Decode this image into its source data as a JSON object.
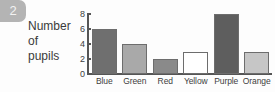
{
  "question": {
    "number": "2"
  },
  "chart_data": {
    "type": "bar",
    "title": "",
    "ylabel_lines": [
      "Number",
      "of",
      "pupils"
    ],
    "ylabel": "Number of pupils",
    "xlabel": "",
    "categories": [
      "Blue",
      "Green",
      "Red",
      "Yellow",
      "Purple",
      "Orange"
    ],
    "values": [
      6,
      4,
      2,
      3,
      8,
      3
    ],
    "bar_colors": [
      "#6f6f6f",
      "#a9a9a9",
      "#8a8a8a",
      "#ffffff",
      "#5e5e5e",
      "#c6c6c6"
    ],
    "ylim": [
      0,
      8
    ],
    "yticks": [
      0,
      2,
      4,
      6,
      8
    ],
    "ytick_labels": [
      "0",
      "2",
      "4",
      "6",
      "8"
    ],
    "grid": false,
    "legend": "none"
  },
  "palette": {
    "badge_bg": "#b4b4b4",
    "badge_text": "#f2f2f2",
    "axis": "#555555",
    "text": "#3d3d3d",
    "bar_outline": "#6d6d6d"
  }
}
